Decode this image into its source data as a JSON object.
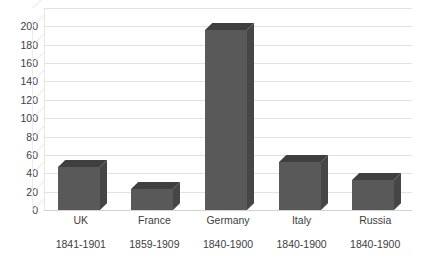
{
  "chart_data": {
    "type": "bar",
    "title": "",
    "subtitle": "",
    "xlabel": "",
    "ylabel": "",
    "categories": [
      "UK",
      "France",
      "Germany",
      "Italy",
      "Russia"
    ],
    "category_sublabels": [
      "1841-1901",
      "1859-1909",
      "1840-1900",
      "1840-1900",
      "1840-1900"
    ],
    "values": [
      47,
      23,
      196,
      52,
      33
    ],
    "series": [
      {
        "name": "",
        "values": [
          47,
          23,
          196,
          52,
          33
        ]
      }
    ],
    "ylim": [
      0,
      220
    ],
    "ytick_values": [
      0,
      20,
      40,
      60,
      80,
      100,
      120,
      140,
      160,
      180,
      200
    ],
    "ytick_labels": [
      "0",
      "20",
      "40",
      "60",
      "80",
      "100",
      "120",
      "140",
      "160",
      "180",
      "200"
    ],
    "ytick_step": 20,
    "grid": true,
    "grid_axis": "y",
    "legend": false,
    "legend_position": "none",
    "three_d": true,
    "annotations": [],
    "colors": {
      "bar_front": "#595959",
      "bar_top": "#3f3f3f",
      "bar_side": "#464646",
      "gridline": "#e2e2e2",
      "baseline": "#d2d2d2",
      "text": "#3f3f3f",
      "background": "#ffffff"
    }
  }
}
